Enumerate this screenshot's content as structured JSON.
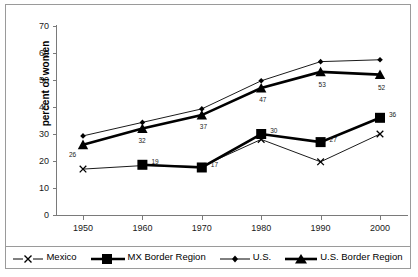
{
  "chart_data": {
    "type": "line",
    "title": "",
    "xlabel": "",
    "ylabel": "percent of women",
    "categories": [
      "1950",
      "1960",
      "1970",
      "1980",
      "1990",
      "2000"
    ],
    "x": [
      1950,
      1960,
      1970,
      1980,
      1990,
      2000
    ],
    "ylim": [
      0,
      70
    ],
    "ytick_step": 10,
    "yticks": [
      "0",
      "10",
      "20",
      "30",
      "40",
      "50",
      "60",
      "70"
    ],
    "grid": false,
    "legend_position": "bottom",
    "series": [
      {
        "name": "Mexico",
        "marker": "x-cross",
        "line": "thin",
        "color": "#000000",
        "values": [
          17.0,
          18.3,
          18.0,
          28.0,
          19.7,
          30.0
        ],
        "point_labels": [
          "",
          "",
          "",
          "",
          "",
          ""
        ]
      },
      {
        "name": "MX Border Region",
        "marker": "filled-square",
        "line": "thick",
        "color": "#000000",
        "values": [
          null,
          18.6,
          17.6,
          30.0,
          27.0,
          36.0
        ],
        "point_labels": [
          "",
          "19",
          "17",
          "30",
          "27",
          "36"
        ]
      },
      {
        "name": "U.S.",
        "marker": "filled-diamond",
        "line": "thin",
        "color": "#000000",
        "values": [
          29.3,
          34.3,
          39.3,
          49.7,
          56.8,
          57.5
        ],
        "point_labels": [
          "",
          "",
          "",
          "",
          "",
          ""
        ]
      },
      {
        "name": "U.S. Border Region",
        "marker": "filled-triangle",
        "line": "thick",
        "color": "#000000",
        "values": [
          26.0,
          32.0,
          37.0,
          47.0,
          53.0,
          52.0
        ],
        "point_labels": [
          "26",
          "32",
          "37",
          "47",
          "53",
          "52"
        ]
      }
    ],
    "annotations": [
      {
        "text": "26",
        "series": "U.S. Border Region",
        "x": "1950"
      },
      {
        "text": "32",
        "series": "U.S. Border Region",
        "x": "1960"
      },
      {
        "text": "37",
        "series": "U.S. Border Region",
        "x": "1970"
      },
      {
        "text": "47",
        "series": "U.S. Border Region",
        "x": "1980"
      },
      {
        "text": "53",
        "series": "U.S. Border Region",
        "x": "1990"
      },
      {
        "text": "52",
        "series": "U.S. Border Region",
        "x": "2000"
      },
      {
        "text": "19",
        "series": "MX Border Region",
        "x": "1960"
      },
      {
        "text": "17",
        "series": "MX Border Region",
        "x": "1970"
      },
      {
        "text": "30",
        "series": "MX Border Region",
        "x": "1980"
      },
      {
        "text": "27",
        "series": "MX Border Region",
        "x": "1990"
      },
      {
        "text": "36",
        "series": "MX Border Region",
        "x": "2000"
      }
    ]
  },
  "axis": {
    "y": {
      "label": "percent of women",
      "ticks": [
        "70",
        "60",
        "50",
        "40",
        "30",
        "20",
        "10",
        "0"
      ]
    },
    "x": {
      "ticks": [
        "1950",
        "1960",
        "1970",
        "1980",
        "1990",
        "2000"
      ]
    }
  },
  "legend": {
    "items": [
      {
        "label": "Mexico",
        "icon": "x-cross-marker-icon"
      },
      {
        "label": "MX Border Region",
        "icon": "filled-square-marker-icon"
      },
      {
        "label": "U.S.",
        "icon": "filled-diamond-marker-icon"
      },
      {
        "label": "U.S. Border Region",
        "icon": "filled-triangle-marker-icon"
      }
    ]
  }
}
